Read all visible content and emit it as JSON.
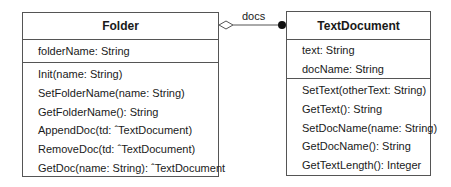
{
  "diagram": {
    "type": "UML class diagram",
    "classes": [
      {
        "name": "Folder",
        "attributes": [
          "folderName: String"
        ],
        "operations": [
          "Init(name: String)",
          "SetFolderName(name: String)",
          "GetFolderName(): String",
          "AppendDoc(td: ˆTextDocument)",
          "RemoveDoc(td: ˆTextDocument)",
          "GetDoc(name: String): ˆTextDocument"
        ]
      },
      {
        "name": "TextDocument",
        "attributes": [
          "text: String",
          "docName: String"
        ],
        "operations": [
          "SetText(otherText: String)",
          "GetText(): String",
          "SetDocName(name: String)",
          "GetDocName(): String",
          "GetTextLength(): Integer"
        ]
      }
    ],
    "association": {
      "label": "docs",
      "source": "Folder",
      "source_end": "hollow-diamond (aggregation)",
      "target": "TextDocument",
      "target_end": "filled-dot (many)"
    }
  }
}
